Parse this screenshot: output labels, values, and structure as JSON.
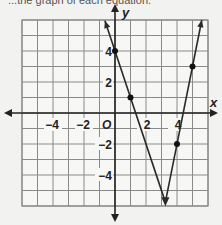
{
  "header": {
    "cropped_text": "...the graph of each equation."
  },
  "chart_data": {
    "type": "line",
    "title": "",
    "xlabel": "x",
    "ylabel": "y",
    "xlim": [
      -6,
      6
    ],
    "ylim": [
      -6,
      6
    ],
    "grid": true,
    "origin_label": "O",
    "x_tick_labels": [
      {
        "value": -4,
        "label": "−4"
      },
      {
        "value": -2,
        "label": "−2"
      },
      {
        "value": 2,
        "label": "2"
      },
      {
        "value": 4,
        "label": "4"
      }
    ],
    "y_tick_labels": [
      {
        "value": 4,
        "label": "4"
      },
      {
        "value": 2,
        "label": "2"
      },
      {
        "value": -2,
        "label": "−2"
      },
      {
        "value": -4,
        "label": "−4"
      }
    ],
    "series": [
      {
        "name": "left branch",
        "description": "line through (0,4) and (1,1), slope -3",
        "points": [
          {
            "x": 0,
            "y": 4
          },
          {
            "x": 1,
            "y": 1
          }
        ],
        "from": {
          "x": -0.65,
          "y": 5.95
        },
        "to": {
          "x": 3.25,
          "y": -5.75
        }
      },
      {
        "name": "right branch",
        "description": "line through (4,-2) and (5,3), slope 5",
        "points": [
          {
            "x": 4,
            "y": -2
          },
          {
            "x": 5,
            "y": 3
          }
        ],
        "from": {
          "x": 3.25,
          "y": -5.75
        },
        "to": {
          "x": 5.6,
          "y": 6.0
        }
      }
    ],
    "vertex": {
      "x": 3.25,
      "y": -5.75
    },
    "colors": {
      "grid": "#8a8a8a",
      "axis": "#222222",
      "line": "#2a2a2a",
      "background": "#f2f2f0"
    }
  }
}
